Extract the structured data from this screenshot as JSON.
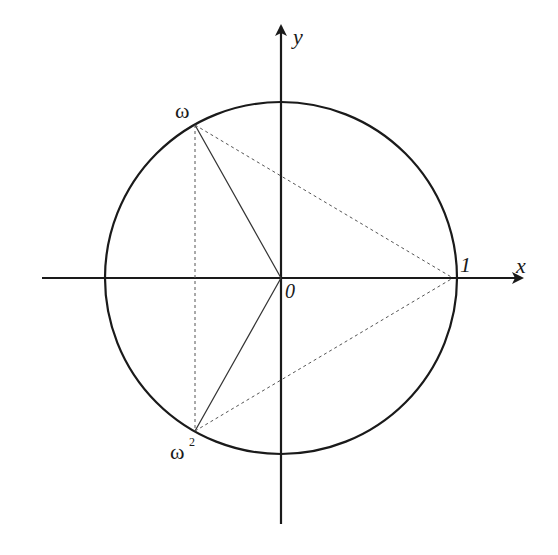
{
  "diagram": {
    "axes": {
      "x_label": "x",
      "y_label": "y"
    },
    "points": {
      "origin": "0",
      "one": "1",
      "omega": "ω",
      "omega_squared_base": "ω",
      "omega_squared_exp": "2"
    },
    "colors": {
      "stroke": "#1a1a1a",
      "dashed": "#555555",
      "background": "#ffffff"
    }
  }
}
